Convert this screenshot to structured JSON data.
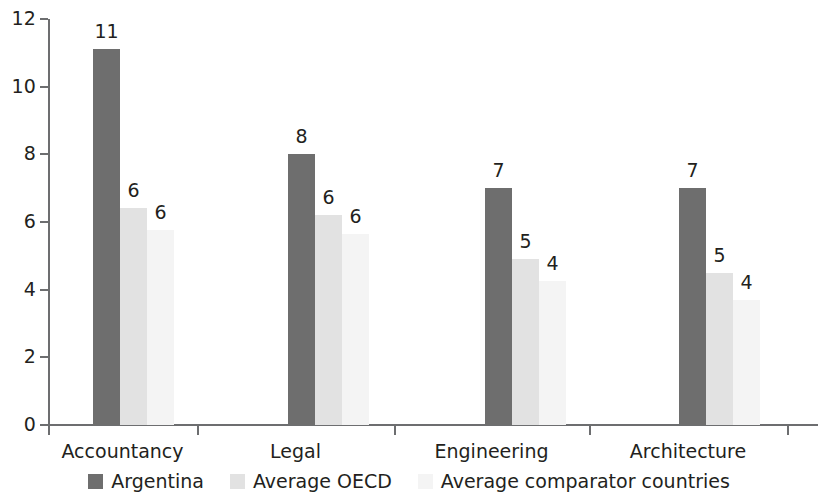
{
  "chart_data": {
    "type": "bar",
    "title": "",
    "subtitle": "",
    "xlabel": "",
    "ylabel": "",
    "ylim": [
      0,
      12
    ],
    "yticks": [
      0,
      2,
      4,
      6,
      8,
      10,
      12
    ],
    "ytick_labels": [
      "0",
      "2",
      "4",
      "6",
      "8",
      "10",
      "12"
    ],
    "grid": false,
    "legend_position": "bottom-center",
    "categories": [
      "Accountancy",
      "Legal",
      "Engineering",
      "Architecture"
    ],
    "series": [
      {
        "name": "Argentina",
        "color": "#6e6e6e",
        "values": [
          11,
          8,
          7,
          7
        ],
        "plotted_values": [
          11.1,
          8.0,
          7.0,
          7.0
        ],
        "labels": [
          "11",
          "8",
          "7",
          "7"
        ]
      },
      {
        "name": "Average OECD",
        "color": "#e2e2e2",
        "values": [
          6,
          6,
          5,
          5
        ],
        "plotted_values": [
          6.4,
          6.2,
          4.9,
          4.5
        ],
        "labels": [
          "6",
          "6",
          "5",
          "5"
        ]
      },
      {
        "name": "Average comparator countries",
        "color": "#f4f4f4",
        "values": [
          6,
          6,
          4,
          4
        ],
        "plotted_values": [
          5.75,
          5.65,
          4.25,
          3.7
        ],
        "labels": [
          "6",
          "6",
          "4",
          "4"
        ]
      }
    ]
  },
  "axis": {
    "y_ticks": [
      "12",
      "10",
      "8",
      "6",
      "4",
      "2",
      "0"
    ]
  },
  "legend": {
    "items": [
      {
        "label": "Argentina",
        "swatch": "dark-gray-swatch"
      },
      {
        "label": "Average OECD",
        "swatch": "light-gray-swatch"
      },
      {
        "label": "Average comparator countries",
        "swatch": "pale-gray-swatch"
      }
    ]
  }
}
